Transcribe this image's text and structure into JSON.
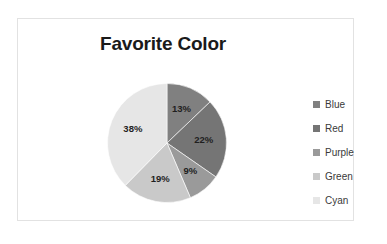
{
  "chart_data": {
    "type": "pie",
    "title": "Favorite Color",
    "categories": [
      "Blue",
      "Red",
      "Purple",
      "Green",
      "Cyan"
    ],
    "values": [
      13,
      22,
      9,
      19,
      38
    ],
    "data_labels": [
      "13%",
      "22%",
      "9%",
      "19%",
      "38%"
    ],
    "colors": [
      "#808080",
      "#757575",
      "#9a9a9a",
      "#c9c9c9",
      "#e6e6e6"
    ],
    "legend_position": "right",
    "grid": false,
    "xlabel": "",
    "ylabel": "",
    "start_angle_deg": 0,
    "direction": "clockwise",
    "units": "percent"
  },
  "frame": {
    "border_color": "#e2e2e2",
    "background": "#ffffff"
  },
  "legend": {
    "items": [
      {
        "label": "Blue",
        "color": "#808080"
      },
      {
        "label": "Red",
        "color": "#757575"
      },
      {
        "label": "Purple",
        "color": "#9a9a9a"
      },
      {
        "label": "Green",
        "color": "#c9c9c9"
      },
      {
        "label": "Cyan",
        "color": "#e6e6e6"
      }
    ]
  }
}
